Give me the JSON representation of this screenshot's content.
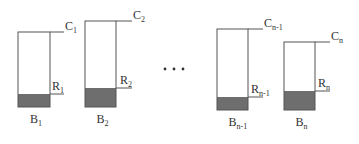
{
  "diagram": {
    "type": "bin-packing-illustration",
    "colors": {
      "stroke": "#555555",
      "fill": "#6e6e6e",
      "background": "#ffffff",
      "text": "#333333"
    },
    "ellipsis": "• • •",
    "bins": [
      {
        "label_base": "B",
        "label_sub": "1",
        "cap_base": "C",
        "cap_sub": "1",
        "res_base": "R",
        "res_sub": "1",
        "x": 18,
        "w": 32,
        "top": 32,
        "bottom": 107,
        "fill_top": 94,
        "line_end": 64
      },
      {
        "label_base": "B",
        "label_sub": "2",
        "cap_base": "C",
        "cap_sub": "2",
        "res_base": "R",
        "res_sub": "2",
        "x": 85,
        "w": 31,
        "top": 21,
        "bottom": 107,
        "fill_top": 88,
        "line_end": 132
      },
      {
        "label_base": "B",
        "label_sub": "n-1",
        "cap_base": "C",
        "cap_sub": "n-1",
        "res_base": "R",
        "res_sub": "n-1",
        "x": 217,
        "w": 31,
        "top": 29,
        "bottom": 110,
        "fill_top": 97,
        "line_end": 263
      },
      {
        "label_base": "B",
        "label_sub": "n",
        "cap_base": "C",
        "cap_sub": "n",
        "res_base": "R",
        "res_sub": "n",
        "x": 284,
        "w": 31,
        "top": 42,
        "bottom": 110,
        "fill_top": 91,
        "line_end": 330
      }
    ]
  }
}
